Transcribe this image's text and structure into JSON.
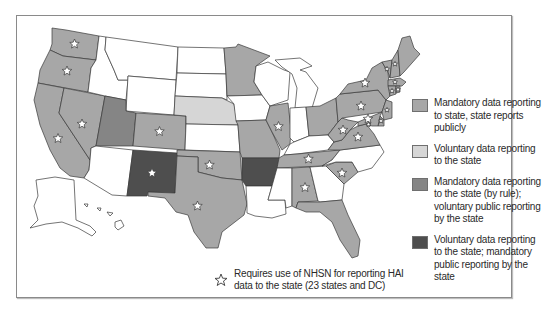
{
  "colors": {
    "mandatory_public": "#a7a7a7",
    "voluntary": "#d6d6d6",
    "mandatory_rule_voluntary_public": "#858585",
    "voluntary_mandatory_public": "#4e4e4e",
    "none": "#ffffff",
    "border": "#3a3a3a"
  },
  "legend": {
    "items": [
      {
        "key": "mandatory_public",
        "label": "Mandatory data reporting to state, state reports publicly"
      },
      {
        "key": "voluntary",
        "label": "Voluntary data reporting to the state"
      },
      {
        "key": "mandatory_rule_voluntary_public",
        "label": "Mandatory data reporting to the state (by rule); voluntary public reporting by the state"
      },
      {
        "key": "voluntary_mandatory_public",
        "label": "Voluntary data reporting to the state; mandatory public reporting by the state"
      }
    ],
    "nhsn": {
      "icon": "star-icon",
      "line1": "Requires use of NHSN for reporting HAI",
      "line2": "data to the state (23 states and DC)"
    }
  },
  "map": {
    "title": "US state HAI reporting requirements",
    "states": {
      "WA": {
        "category": "mandatory_public",
        "nhsn": true
      },
      "OR": {
        "category": "mandatory_public",
        "nhsn": true
      },
      "CA": {
        "category": "mandatory_public",
        "nhsn": true
      },
      "NV": {
        "category": "mandatory_public",
        "nhsn": true
      },
      "ID": {
        "category": "none",
        "nhsn": false
      },
      "MT": {
        "category": "none",
        "nhsn": false
      },
      "WY": {
        "category": "none",
        "nhsn": false
      },
      "UT": {
        "category": "mandatory_rule_voluntary_public",
        "nhsn": false
      },
      "CO": {
        "category": "mandatory_public",
        "nhsn": true
      },
      "AZ": {
        "category": "none",
        "nhsn": false
      },
      "NM": {
        "category": "voluntary_mandatory_public",
        "nhsn": true
      },
      "ND": {
        "category": "none",
        "nhsn": false
      },
      "SD": {
        "category": "none",
        "nhsn": false
      },
      "NE": {
        "category": "voluntary",
        "nhsn": false
      },
      "KS": {
        "category": "none",
        "nhsn": false
      },
      "OK": {
        "category": "mandatory_public",
        "nhsn": true
      },
      "TX": {
        "category": "mandatory_public",
        "nhsn": true
      },
      "MN": {
        "category": "mandatory_public",
        "nhsn": false
      },
      "IA": {
        "category": "none",
        "nhsn": false
      },
      "MO": {
        "category": "mandatory_public",
        "nhsn": false
      },
      "AR": {
        "category": "voluntary_mandatory_public",
        "nhsn": false
      },
      "LA": {
        "category": "none",
        "nhsn": false
      },
      "WI": {
        "category": "none",
        "nhsn": false
      },
      "IL": {
        "category": "mandatory_public",
        "nhsn": true
      },
      "MI": {
        "category": "none",
        "nhsn": false
      },
      "IN": {
        "category": "none",
        "nhsn": false
      },
      "OH": {
        "category": "mandatory_public",
        "nhsn": false
      },
      "KY": {
        "category": "none",
        "nhsn": false
      },
      "TN": {
        "category": "mandatory_public",
        "nhsn": true
      },
      "MS": {
        "category": "none",
        "nhsn": false
      },
      "AL": {
        "category": "mandatory_public",
        "nhsn": true
      },
      "GA": {
        "category": "none",
        "nhsn": false
      },
      "FL": {
        "category": "mandatory_public",
        "nhsn": false
      },
      "SC": {
        "category": "mandatory_public",
        "nhsn": true
      },
      "NC": {
        "category": "none",
        "nhsn": false
      },
      "VA": {
        "category": "mandatory_public",
        "nhsn": true
      },
      "WV": {
        "category": "mandatory_public",
        "nhsn": true
      },
      "PA": {
        "category": "mandatory_public",
        "nhsn": true
      },
      "NY": {
        "category": "mandatory_public",
        "nhsn": true
      },
      "VT": {
        "category": "mandatory_public",
        "nhsn": true
      },
      "NH": {
        "category": "mandatory_public",
        "nhsn": true
      },
      "ME": {
        "category": "mandatory_public",
        "nhsn": false
      },
      "MA": {
        "category": "mandatory_public",
        "nhsn": true
      },
      "CT": {
        "category": "mandatory_public",
        "nhsn": true
      },
      "RI": {
        "category": "mandatory_public",
        "nhsn": true
      },
      "NJ": {
        "category": "mandatory_public",
        "nhsn": true
      },
      "DE": {
        "category": "mandatory_public",
        "nhsn": true
      },
      "MD": {
        "category": "mandatory_public",
        "nhsn": true
      },
      "DC": {
        "category": "mandatory_public",
        "nhsn": true
      },
      "AK": {
        "category": "none",
        "nhsn": false
      },
      "HI": {
        "category": "none",
        "nhsn": false
      }
    }
  }
}
